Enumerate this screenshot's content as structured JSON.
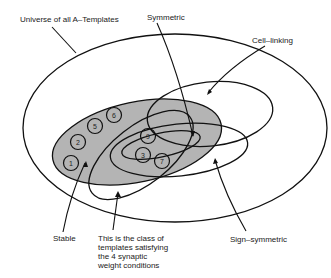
{
  "labels": {
    "universe": "Universe of all A–Templates",
    "symmetric": "Symmetric",
    "cell_linking": "Cell–linking",
    "stable": "Stable",
    "sign_symmetric": "Sign–symmetric",
    "four_conditions": [
      "This is the class of",
      "templates satisfying",
      "the 4 synaptic",
      "weight conditions"
    ]
  },
  "circles": [
    {
      "n": "1",
      "x": 71,
      "y": 163
    },
    {
      "n": "2",
      "x": 78,
      "y": 142
    },
    {
      "n": "5",
      "x": 95,
      "y": 126
    },
    {
      "n": "6",
      "x": 114,
      "y": 115
    },
    {
      "n": "9",
      "x": 148,
      "y": 136
    },
    {
      "n": "3",
      "x": 143,
      "y": 155
    },
    {
      "n": "7",
      "x": 162,
      "y": 161
    }
  ],
  "colors": {
    "stroke": "#111111",
    "stable_fill": "#b4b4b4",
    "background": "#ffffff"
  }
}
